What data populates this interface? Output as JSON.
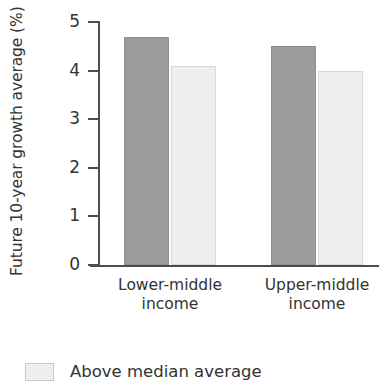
{
  "chart_data": {
    "type": "bar",
    "title": "",
    "subtitle": "",
    "xlabel": "",
    "ylabel": "Future 10-year growth average (%)",
    "categories": [
      "Lower-middle\nincome",
      "Upper-middle\nincome"
    ],
    "category_lines": [
      [
        "Lower-middle",
        "income"
      ],
      [
        "Upper-middle",
        "income"
      ]
    ],
    "series": [
      {
        "name": "Below median average",
        "color": "#9c9c9c",
        "values": [
          4.7,
          4.5
        ]
      },
      {
        "name": "Above median average",
        "color": "#efefef",
        "values": [
          4.1,
          4.0
        ]
      }
    ],
    "ylim": [
      0,
      5
    ],
    "yticks": [
      0,
      1,
      2,
      3,
      4,
      5
    ],
    "ytick_labels": [
      "0",
      "1",
      "2",
      "3",
      "4",
      "5"
    ],
    "grid": false,
    "legend_position": "bottom-left",
    "legend_entries": [
      {
        "label": "Above median average",
        "swatch_color": "#efefef",
        "swatch_border": "#c9c9c9"
      }
    ],
    "axis_color": "#4d4d4d",
    "text_color": "#333333",
    "background": "#ffffff"
  },
  "legend": {
    "entry_label": "Above median average"
  }
}
